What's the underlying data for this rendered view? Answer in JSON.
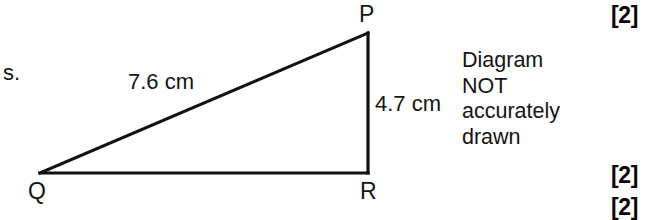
{
  "figure": {
    "type": "geometry-diagram",
    "shape": "right-angled-triangle",
    "background_color": "#ffffff",
    "line_color": "#121212",
    "vertices": [
      {
        "name": "P",
        "label": "P",
        "x": 368,
        "y": 33
      },
      {
        "name": "Q",
        "label": "Q",
        "x": 40,
        "y": 173
      },
      {
        "name": "R",
        "label": "R",
        "x": 368,
        "y": 173
      }
    ],
    "sides": [
      {
        "name": "QP",
        "from": "Q",
        "to": "P",
        "measure": "7.6 cm"
      },
      {
        "name": "PR",
        "from": "P",
        "to": "R",
        "measure": "4.7 cm"
      },
      {
        "name": "QR",
        "from": "Q",
        "to": "R",
        "measure": ""
      }
    ],
    "measure_labels": {
      "hypotenuse": "7.6 cm",
      "vertical": "4.7 cm"
    },
    "note": {
      "lines": [
        "Diagram",
        "NOT",
        "accurately",
        "drawn"
      ]
    }
  },
  "page": {
    "fragment_text": "s.",
    "marks": [
      {
        "label": "[2]"
      },
      {
        "label": "[2]"
      },
      {
        "label": "[2]"
      }
    ]
  }
}
